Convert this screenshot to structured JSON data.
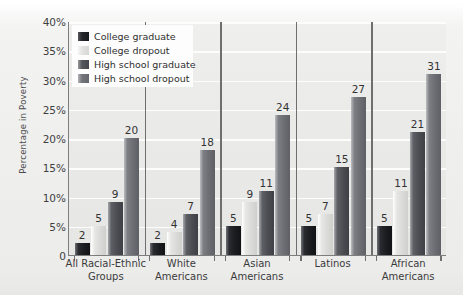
{
  "chart_data": {
    "type": "bar",
    "title": "",
    "xlabel": "",
    "ylabel": "Percentage in Poverty",
    "ylim": [
      0,
      40
    ],
    "ytick_labels": [
      "40%",
      "35%",
      "30%",
      "25%",
      "20%",
      "15%",
      "10%",
      "5%",
      "0"
    ],
    "ytick_values": [
      40,
      35,
      30,
      25,
      20,
      15,
      10,
      5,
      0
    ],
    "grid": true,
    "legend_position": "top-left",
    "categories": [
      "All Racial-Ethnic Groups",
      "White Americans",
      "Asian Americans",
      "Latinos",
      "African Americans"
    ],
    "category_lines": [
      [
        "All Racial-Ethnic",
        "Groups"
      ],
      [
        "White",
        "Americans"
      ],
      [
        "Asian",
        "Americans"
      ],
      [
        "Latinos",
        ""
      ],
      [
        "African",
        "Americans"
      ]
    ],
    "series": [
      {
        "name": "College graduate",
        "color": "#1b1c20",
        "values": [
          2,
          2,
          5,
          5,
          5
        ]
      },
      {
        "name": "College dropout",
        "color": "#d9d9d7",
        "values": [
          5,
          4,
          9,
          7,
          11
        ]
      },
      {
        "name": "High school graduate",
        "color": "#4a4c51",
        "values": [
          9,
          7,
          11,
          15,
          21
        ]
      },
      {
        "name": "High school dropout",
        "color": "#6b6d72",
        "values": [
          20,
          18,
          24,
          27,
          31
        ]
      }
    ],
    "data_labels": [
      [
        "2",
        "5",
        "9",
        "20"
      ],
      [
        "2",
        "4",
        "7",
        "18"
      ],
      [
        "5",
        "9",
        "11",
        "24"
      ],
      [
        "5",
        "7",
        "15",
        "27"
      ],
      [
        "5",
        "11",
        "21",
        "31"
      ]
    ]
  }
}
